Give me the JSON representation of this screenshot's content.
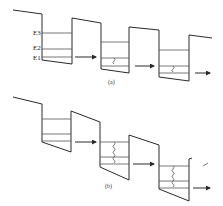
{
  "figure": {
    "panel_a": {
      "caption": "(a)",
      "energy_labels": [
        "E3",
        "E2",
        "E1"
      ]
    },
    "panel_b": {
      "caption": "(b)"
    },
    "colors": {
      "line": "#2a2a2a",
      "background": "#ffffff"
    }
  }
}
